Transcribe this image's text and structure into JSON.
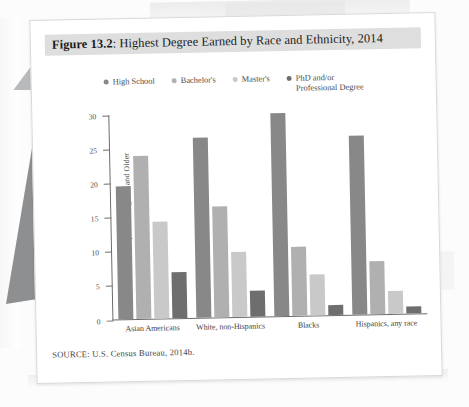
{
  "figure": {
    "label_prefix": "Figure 13.2",
    "title_separator": ": ",
    "title_text": "Highest Degree Earned by Race and Ethnicity, 2014",
    "source": "SOURCE: U.S. Census Bureau, 2014b."
  },
  "chart_data": {
    "type": "bar",
    "title": "Highest Degree Earned by Race and Ethnicity, 2014",
    "xlabel": "",
    "ylabel": "Percent of Population Age 25 and Older",
    "ylim": [
      0,
      30
    ],
    "yticks": [
      0,
      5,
      10,
      15,
      20,
      25,
      30
    ],
    "ytick_labels": [
      "0",
      "5",
      "10",
      "15",
      "20",
      "25",
      "30"
    ],
    "grid": false,
    "legend_position": "top",
    "categories": [
      "Asian Americans",
      "White, non-Hispanics",
      "Blacks",
      "Hispanics, any race"
    ],
    "series": [
      {
        "name": "High School",
        "color": "#888888",
        "values": [
          19.5,
          26.5,
          29.8,
          26.3
        ]
      },
      {
        "name": "Bachelor's",
        "color": "#b0b0b0",
        "values": [
          24.0,
          16.3,
          10.2,
          7.8
        ]
      },
      {
        "name": "Master's",
        "color": "#c9c9c9",
        "values": [
          14.3,
          9.5,
          6.0,
          3.4
        ]
      },
      {
        "name": "PhD and/or\nProfessional Degree",
        "color": "#6e6e6e",
        "values": [
          6.7,
          3.8,
          1.5,
          1.0
        ]
      }
    ]
  },
  "legend": [
    {
      "label": "High School",
      "color": "#888888"
    },
    {
      "label": "Bachelor's",
      "color": "#b0b0b0"
    },
    {
      "label": "Master's",
      "color": "#c9c9c9"
    },
    {
      "label_line1": "PhD and/or",
      "label_line2": "Professional Degree",
      "color": "#6e6e6e"
    }
  ],
  "colors": {
    "card_background": "#ffffff",
    "title_band": "#dedede",
    "axis": "#6d6d6d",
    "page_background": "#fcfcfc"
  }
}
